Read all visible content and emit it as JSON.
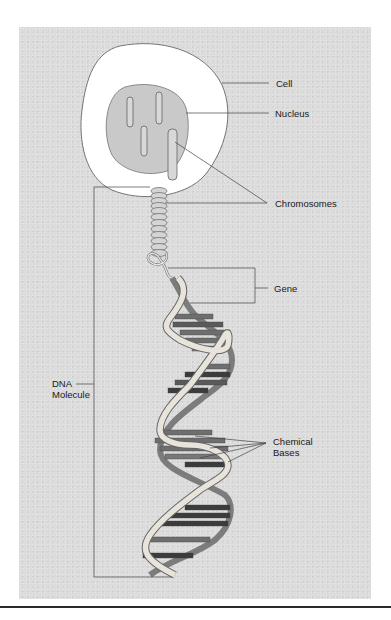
{
  "figure": {
    "labels": {
      "cell": "Cell",
      "nucleus": "Nucleus",
      "chromosomes": "Chromosomes",
      "gene": "Gene",
      "dna_line1": "DNA",
      "dna_line2": "Molecule",
      "bases_line1": "Chemical",
      "bases_line2": "Bases"
    },
    "colors": {
      "background_panel": "#dcdcdc",
      "cell_fill": "#ffffff",
      "nucleus_fill": "#c8c8c8",
      "strand_light": "#e8e4dc",
      "strand_dark": "#8a8a8a",
      "base_dark": "#3c3c3c",
      "base_mid": "#6e6e6e",
      "line": "#444444"
    }
  }
}
